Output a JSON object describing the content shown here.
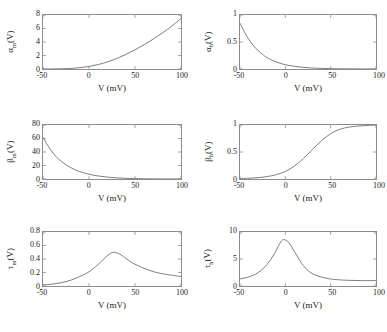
{
  "figure": {
    "background": "#ffffff",
    "curve_color": "#6e6e6e",
    "axis_color": "#8c8c8c",
    "xlabel": "V (mV)"
  },
  "chart_data": [
    {
      "type": "line",
      "panel": "top-left",
      "title": "",
      "ylabel": "αm(V)",
      "ylabel_base": "α",
      "ylabel_sub": "m",
      "ylabel_tail": "(V)",
      "xlabel": "V (mV)",
      "xlim": [
        -50,
        100
      ],
      "ylim": [
        0,
        8
      ],
      "xticks": [
        -50,
        0,
        50,
        100
      ],
      "yticks": [
        0,
        2,
        4,
        6,
        8
      ],
      "grid": false,
      "legend": "none",
      "x": [
        -50,
        -40,
        -30,
        -20,
        -10,
        0,
        10,
        20,
        30,
        40,
        50,
        60,
        70,
        80,
        90,
        100
      ],
      "y": [
        0.0,
        0.01,
        0.03,
        0.08,
        0.2,
        0.38,
        0.66,
        1.05,
        1.55,
        2.15,
        2.85,
        3.6,
        4.45,
        5.35,
        6.35,
        7.5
      ]
    },
    {
      "type": "line",
      "panel": "top-right",
      "title": "",
      "ylabel": "αh(V)",
      "ylabel_base": "α",
      "ylabel_sub": "h",
      "ylabel_tail": "(V)",
      "xlabel": "V (mV)",
      "xlim": [
        -50,
        100
      ],
      "ylim": [
        0,
        1
      ],
      "xticks": [
        -50,
        0,
        50,
        100
      ],
      "yticks": [
        0,
        0.5,
        1
      ],
      "grid": false,
      "legend": "none",
      "x": [
        -50,
        -45,
        -40,
        -35,
        -30,
        -25,
        -20,
        -10,
        0,
        10,
        20,
        30,
        40,
        50,
        60,
        80,
        100
      ],
      "y": [
        0.85,
        0.68,
        0.54,
        0.43,
        0.34,
        0.27,
        0.21,
        0.13,
        0.08,
        0.05,
        0.03,
        0.018,
        0.011,
        0.007,
        0.004,
        0.002,
        0.001
      ]
    },
    {
      "type": "line",
      "panel": "middle-left",
      "title": "",
      "ylabel": "βm(V)",
      "ylabel_base": "β",
      "ylabel_sub": "m",
      "ylabel_tail": "(V)",
      "xlabel": "V (mV)",
      "xlim": [
        -50,
        100
      ],
      "ylim": [
        0,
        80
      ],
      "xticks": [
        -50,
        0,
        50,
        100
      ],
      "yticks": [
        0,
        20,
        40,
        60,
        80
      ],
      "grid": false,
      "legend": "none",
      "x": [
        -50,
        -45,
        -40,
        -35,
        -30,
        -25,
        -20,
        -15,
        -10,
        0,
        10,
        20,
        30,
        40,
        50,
        70,
        100
      ],
      "y": [
        62,
        50,
        40,
        32,
        26,
        21,
        17,
        13.5,
        11,
        7,
        4.5,
        2.8,
        1.7,
        1.0,
        0.6,
        0.2,
        0.05
      ]
    },
    {
      "type": "line",
      "panel": "middle-right",
      "title": "",
      "ylabel": "βh(V)",
      "ylabel_base": "β",
      "ylabel_sub": "h",
      "ylabel_tail": "(V)",
      "xlabel": "V (mV)",
      "xlim": [
        -50,
        100
      ],
      "ylim": [
        0,
        1
      ],
      "xticks": [
        -50,
        0,
        50,
        100
      ],
      "yticks": [
        0,
        0.5,
        1
      ],
      "grid": false,
      "legend": "none",
      "x": [
        -50,
        -40,
        -30,
        -20,
        -10,
        0,
        10,
        20,
        30,
        40,
        50,
        60,
        70,
        80,
        90,
        100
      ],
      "y": [
        0.01,
        0.015,
        0.025,
        0.045,
        0.08,
        0.14,
        0.24,
        0.38,
        0.55,
        0.71,
        0.84,
        0.92,
        0.96,
        0.98,
        0.99,
        1.0
      ]
    },
    {
      "type": "line",
      "panel": "bottom-left",
      "title": "",
      "ylabel": "τm(V)",
      "ylabel_base": "τ",
      "ylabel_sub": "m",
      "ylabel_tail": "(V)",
      "xlabel": "V (mV)",
      "xlim": [
        -50,
        100
      ],
      "ylim": [
        0,
        0.8
      ],
      "xticks": [
        -50,
        0,
        50,
        100
      ],
      "yticks": [
        0,
        0.2,
        0.4,
        0.6,
        0.8
      ],
      "grid": false,
      "legend": "none",
      "x": [
        -50,
        -40,
        -30,
        -20,
        -10,
        0,
        10,
        20,
        27,
        35,
        45,
        55,
        65,
        75,
        85,
        100
      ],
      "y": [
        0.016,
        0.028,
        0.05,
        0.085,
        0.14,
        0.21,
        0.32,
        0.45,
        0.5,
        0.46,
        0.36,
        0.29,
        0.235,
        0.195,
        0.17,
        0.14
      ]
    },
    {
      "type": "line",
      "panel": "bottom-right",
      "title": "",
      "ylabel": "τh(V)",
      "ylabel_base": "τ",
      "ylabel_sub": "h",
      "ylabel_tail": "(V)",
      "xlabel": "V (mV)",
      "xlim": [
        -50,
        100
      ],
      "ylim": [
        0,
        10
      ],
      "xticks": [
        -50,
        0,
        50,
        100
      ],
      "yticks": [
        0,
        5,
        10
      ],
      "grid": false,
      "legend": "none",
      "x": [
        -50,
        -40,
        -30,
        -20,
        -12,
        -6,
        -2,
        4,
        10,
        18,
        26,
        35,
        45,
        55,
        70,
        85,
        100
      ],
      "y": [
        1.3,
        1.7,
        2.5,
        4.0,
        6.0,
        7.9,
        8.6,
        8.0,
        6.4,
        4.2,
        2.7,
        1.9,
        1.45,
        1.2,
        1.05,
        1.0,
        1.0
      ]
    }
  ]
}
